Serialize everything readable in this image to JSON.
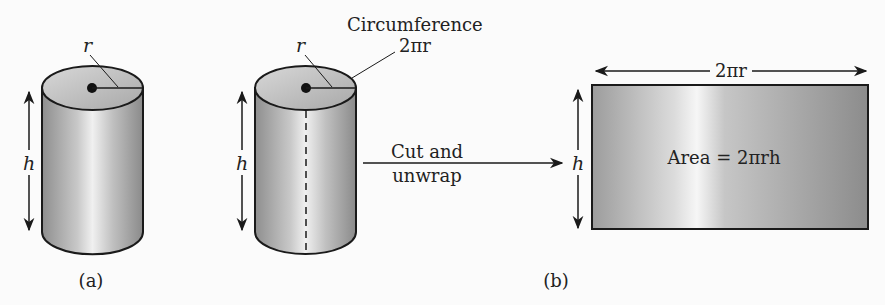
{
  "figure": {
    "panel_a": {
      "caption": "(a)",
      "radius_label": "r",
      "height_label": "h"
    },
    "panel_b": {
      "caption": "(b)",
      "cylinder": {
        "radius_label": "r",
        "height_label": "h",
        "circumference_label": "Circumference",
        "circumference_value": "2πr"
      },
      "transition": {
        "line1": "Cut and",
        "line2": "unwrap"
      },
      "rectangle": {
        "width_label": "2πr",
        "height_label": "h",
        "area_label": "Area = 2πrh"
      }
    },
    "colors": {
      "stroke": "#1a1a1a",
      "fill_dark": "#9a9a9a",
      "fill_light": "#f2f2f2",
      "background": "#fbfbfb"
    }
  }
}
